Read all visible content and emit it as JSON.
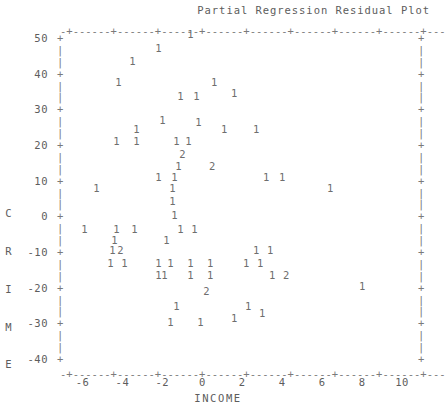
{
  "chart_data": {
    "type": "scatter",
    "title": "Partial Regression Residual Plot",
    "xlabel": "INCOME",
    "ylabel": "CRIME",
    "xlim": [
      -7.0,
      11.0
    ],
    "ylim": [
      -40,
      50
    ],
    "xticks": [
      -6,
      -4,
      -2,
      0,
      2,
      4,
      6,
      8,
      10
    ],
    "yticks": [
      50,
      40,
      30,
      20,
      10,
      0,
      -10,
      -20,
      -30,
      -40
    ],
    "xtick_labels": [
      "-6",
      "-4",
      "-2",
      "0",
      "2",
      "4",
      "6",
      "8",
      "10"
    ],
    "ytick_labels": [
      "50",
      "40",
      "30",
      "20",
      "10",
      "0",
      "-10",
      "-20",
      "-30",
      "-40"
    ],
    "grid": false,
    "legend": null,
    "marker_style": "count-digit",
    "marker_note": "Each plotted character is the count of observations at that cell; 1 = one point, 2 = two coincident points.",
    "points": [
      {
        "x": -0.6,
        "y": 51.0,
        "label": "1"
      },
      {
        "x": -2.2,
        "y": 47.2,
        "label": "1"
      },
      {
        "x": -3.5,
        "y": 43.6,
        "label": "1"
      },
      {
        "x": -4.2,
        "y": 37.8,
        "label": "1"
      },
      {
        "x": 0.6,
        "y": 37.8,
        "label": "1"
      },
      {
        "x": -1.1,
        "y": 33.8,
        "label": "1"
      },
      {
        "x": -0.3,
        "y": 33.8,
        "label": "1"
      },
      {
        "x": 1.6,
        "y": 34.6,
        "label": "1"
      },
      {
        "x": -2.0,
        "y": 27.0,
        "label": "1"
      },
      {
        "x": -0.2,
        "y": 26.5,
        "label": "1"
      },
      {
        "x": -3.3,
        "y": 24.5,
        "label": "1"
      },
      {
        "x": 1.1,
        "y": 24.5,
        "label": "1"
      },
      {
        "x": 2.7,
        "y": 24.5,
        "label": "1"
      },
      {
        "x": -4.3,
        "y": 21.0,
        "label": "1"
      },
      {
        "x": -3.3,
        "y": 21.0,
        "label": "1"
      },
      {
        "x": -1.3,
        "y": 21.0,
        "label": "1"
      },
      {
        "x": -0.7,
        "y": 21.0,
        "label": "1"
      },
      {
        "x": -1.0,
        "y": 17.5,
        "label": "2"
      },
      {
        "x": -1.2,
        "y": 14.2,
        "label": "1"
      },
      {
        "x": 0.5,
        "y": 14.2,
        "label": "2"
      },
      {
        "x": -2.2,
        "y": 11.0,
        "label": "1"
      },
      {
        "x": -1.4,
        "y": 11.0,
        "label": "1"
      },
      {
        "x": 3.2,
        "y": 11.0,
        "label": "1"
      },
      {
        "x": 4.0,
        "y": 11.0,
        "label": "1"
      },
      {
        "x": -5.3,
        "y": 8.0,
        "label": "1"
      },
      {
        "x": -1.5,
        "y": 8.0,
        "label": "1"
      },
      {
        "x": 6.4,
        "y": 8.0,
        "label": "1"
      },
      {
        "x": -1.5,
        "y": 4.2,
        "label": "1"
      },
      {
        "x": -1.4,
        "y": 0.5,
        "label": "1"
      },
      {
        "x": -5.9,
        "y": -3.5,
        "label": "1"
      },
      {
        "x": -4.3,
        "y": -3.5,
        "label": "1"
      },
      {
        "x": -3.4,
        "y": -3.5,
        "label": "1"
      },
      {
        "x": -1.1,
        "y": -3.5,
        "label": "1"
      },
      {
        "x": -0.4,
        "y": -3.5,
        "label": "1"
      },
      {
        "x": -4.4,
        "y": -6.5,
        "label": "1"
      },
      {
        "x": -1.8,
        "y": -6.5,
        "label": "1"
      },
      {
        "x": -4.5,
        "y": -9.5,
        "label": "1"
      },
      {
        "x": -4.1,
        "y": -9.5,
        "label": "2"
      },
      {
        "x": 2.7,
        "y": -9.5,
        "label": "1"
      },
      {
        "x": 3.4,
        "y": -9.5,
        "label": "1"
      },
      {
        "x": -4.6,
        "y": -13.0,
        "label": "1"
      },
      {
        "x": -3.9,
        "y": -13.0,
        "label": "1"
      },
      {
        "x": -2.2,
        "y": -13.0,
        "label": "1"
      },
      {
        "x": -1.6,
        "y": -13.0,
        "label": "1"
      },
      {
        "x": -0.6,
        "y": -13.0,
        "label": "1"
      },
      {
        "x": 0.4,
        "y": -13.0,
        "label": "1"
      },
      {
        "x": 2.2,
        "y": -13.0,
        "label": "1"
      },
      {
        "x": 2.9,
        "y": -13.0,
        "label": "1"
      },
      {
        "x": -2.2,
        "y": -16.5,
        "label": "1"
      },
      {
        "x": -1.9,
        "y": -16.5,
        "label": "1"
      },
      {
        "x": -0.6,
        "y": -16.5,
        "label": "1"
      },
      {
        "x": 0.4,
        "y": -16.5,
        "label": "1"
      },
      {
        "x": 3.5,
        "y": -16.5,
        "label": "1"
      },
      {
        "x": 4.2,
        "y": -16.5,
        "label": "2"
      },
      {
        "x": 8.0,
        "y": -19.5,
        "label": "1"
      },
      {
        "x": 0.2,
        "y": -21.0,
        "label": "2"
      },
      {
        "x": -1.3,
        "y": -25.0,
        "label": "1"
      },
      {
        "x": 2.3,
        "y": -25.0,
        "label": "1"
      },
      {
        "x": -1.6,
        "y": -29.5,
        "label": "1"
      },
      {
        "x": -0.1,
        "y": -29.5,
        "label": "1"
      },
      {
        "x": 1.6,
        "y": -28.5,
        "label": "1"
      },
      {
        "x": 3.0,
        "y": -27.0,
        "label": "1"
      }
    ]
  },
  "axis_decoration": {
    "top_rule": "-+------+------+------+------+------+------+------+------+---",
    "bottom_rule": "-+------+------+------+------+------+------+------+------+---",
    "tick_glyph": "+",
    "bar_glyph": "|"
  },
  "colors": {
    "background": "#ffffff",
    "ink": "#6b6b6b",
    "rule": "#7a7a7a",
    "label": "#5d5d5d"
  }
}
